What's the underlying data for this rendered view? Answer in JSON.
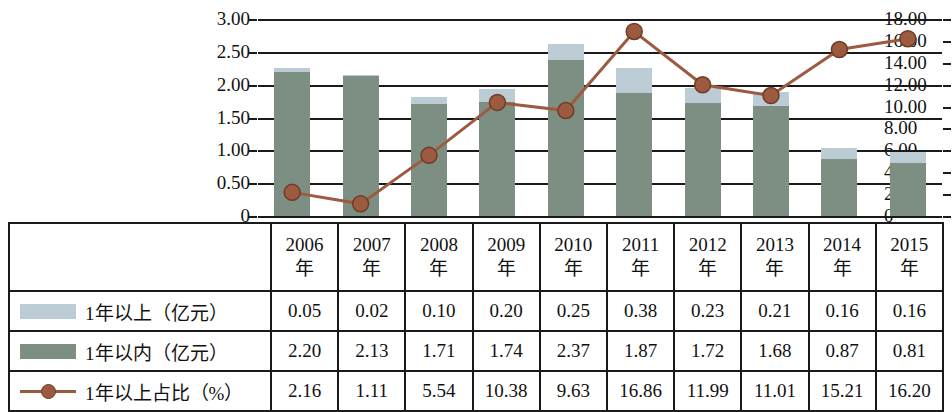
{
  "chart_data": {
    "type": "bar",
    "title": "",
    "xlabel": "",
    "ylabel": "",
    "y2label": "",
    "grid": true,
    "legend_position": "table-left-column",
    "categories": [
      "2006年",
      "2007年",
      "2008年",
      "2009年",
      "2010年",
      "2011年",
      "2012年",
      "2013年",
      "2014年",
      "2015年"
    ],
    "category_numbers": [
      "2006",
      "2007",
      "2008",
      "2009",
      "2010",
      "2011",
      "2012",
      "2013",
      "2014",
      "2015"
    ],
    "category_suffix": "年",
    "ylim": [
      0,
      3.0
    ],
    "y2lim": [
      0,
      18.0
    ],
    "yticks": [
      "0",
      "0.50",
      "1.00",
      "1.50",
      "2.00",
      "2.50",
      "3.00"
    ],
    "ytick_values": [
      0,
      0.5,
      1.0,
      1.5,
      2.0,
      2.5,
      3.0
    ],
    "y2ticks": [
      "0",
      "2.00",
      "4.00",
      "6.00",
      "8.00",
      "10.00",
      "12.00",
      "14.00",
      "16.00",
      "18.00"
    ],
    "y2tick_values": [
      0,
      2,
      4,
      6,
      8,
      10,
      12,
      14,
      16,
      18
    ],
    "series": [
      {
        "name": "1年以上（亿元）",
        "kind": "bar-stacked-upper",
        "axis": "left",
        "color": "#bcccd4",
        "values": [
          0.05,
          0.02,
          0.1,
          0.2,
          0.25,
          0.38,
          0.23,
          0.21,
          0.16,
          0.16
        ]
      },
      {
        "name": "1年以内（亿元）",
        "kind": "bar-stacked-lower",
        "axis": "left",
        "color": "#7d8f83",
        "values": [
          2.2,
          2.13,
          1.71,
          1.74,
          2.37,
          1.87,
          1.72,
          1.68,
          0.87,
          0.81
        ]
      },
      {
        "name": "1年以上占比（%）",
        "kind": "line-marker",
        "axis": "right",
        "color": "#9c5b40",
        "values": [
          2.16,
          1.11,
          5.54,
          10.38,
          9.63,
          16.86,
          11.99,
          11.01,
          15.21,
          16.2
        ]
      }
    ]
  },
  "table": {
    "rows": [
      {
        "legend": "1年以上（亿元）",
        "swatch": "swatch-upper",
        "cells": [
          "0.05",
          "0.02",
          "0.10",
          "0.20",
          "0.25",
          "0.38",
          "0.23",
          "0.21",
          "0.16",
          "0.16"
        ]
      },
      {
        "legend": "1年以内（亿元）",
        "swatch": "swatch-lower",
        "cells": [
          "2.20",
          "2.13",
          "1.71",
          "1.74",
          "2.37",
          "1.87",
          "1.72",
          "1.68",
          "0.87",
          "0.81"
        ]
      },
      {
        "legend": "1年以上占比（%）",
        "swatch": "swatch-line",
        "cells": [
          "2.16",
          "1.11",
          "5.54",
          "10.38",
          "9.63",
          "16.86",
          "11.99",
          "11.01",
          "15.21",
          "16.20"
        ]
      }
    ]
  }
}
